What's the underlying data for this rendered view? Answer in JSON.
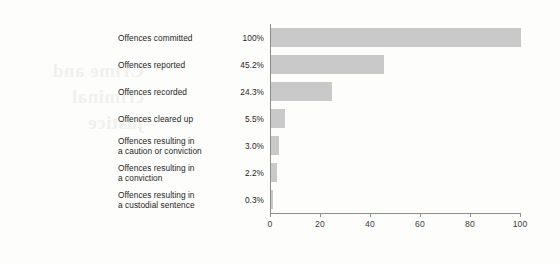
{
  "chart_data": {
    "type": "bar",
    "orientation": "horizontal",
    "title": "",
    "subtitle": "",
    "xlabel": "",
    "ylabel": "",
    "xlim": [
      0,
      100
    ],
    "xticks": [
      0,
      20,
      40,
      60,
      80,
      100
    ],
    "xtick_labels": [
      "0",
      "20",
      "40",
      "60",
      "80",
      "100"
    ],
    "grid": false,
    "legend": null,
    "bar_color": "#c9c9c9",
    "axis_color": "#8d8d8d",
    "text_color": "#1d1d1d",
    "background_color": "#fdfdfb",
    "categories": [
      "Offences committed",
      "Offences reported",
      "Offences recorded",
      "Offences cleared up",
      "Offences resulting in a caution or conviction",
      "Offences resulting in a conviction",
      "Offences resulting in a custodial sentence"
    ],
    "values": [
      100,
      45.2,
      24.3,
      5.5,
      3.0,
      2.2,
      0.3
    ],
    "value_labels": [
      "100%",
      "45.2%",
      "24.3%",
      "5.5%",
      "3.0%",
      "2.2%",
      "0.3%"
    ]
  },
  "rows": [
    {
      "label_line1": "Offences committed",
      "label_line2": "",
      "value_label": "100%",
      "value": 100
    },
    {
      "label_line1": "Offences reported",
      "label_line2": "",
      "value_label": "45.2%",
      "value": 45.2
    },
    {
      "label_line1": "Offences recorded",
      "label_line2": "",
      "value_label": "24.3%",
      "value": 24.3
    },
    {
      "label_line1": "Offences cleared up",
      "label_line2": "",
      "value_label": "5.5%",
      "value": 5.5
    },
    {
      "label_line1": "Offences resulting in",
      "label_line2": "a caution or conviction",
      "value_label": "3.0%",
      "value": 3.0
    },
    {
      "label_line1": "Offences resulting in",
      "label_line2": "a conviction",
      "value_label": "2.2%",
      "value": 2.2
    },
    {
      "label_line1": "Offences resulting in",
      "label_line2": "a custodial sentence",
      "value_label": "0.3%",
      "value": 0.3
    }
  ],
  "axis": {
    "ticks": [
      "0",
      "20",
      "40",
      "60",
      "80",
      "100"
    ]
  },
  "ghost_text": {
    "line1": "Crime and",
    "line2": "criminal justice"
  }
}
